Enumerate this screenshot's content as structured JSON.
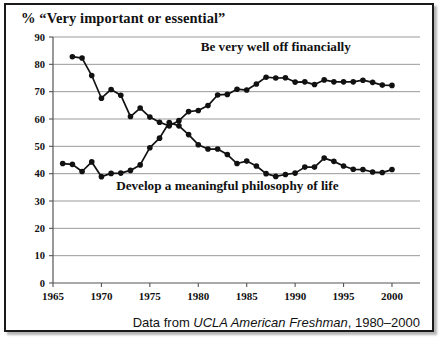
{
  "figure": {
    "title": "% “Very important or essential”",
    "caption_prefix": "Data from ",
    "caption_source": "UCLA American Freshman",
    "caption_suffix": ", 1980–2000",
    "border_color": "#1a1a1a",
    "background_color": "#ffffff"
  },
  "chart_data": {
    "type": "line",
    "title": "% “Very important or essential”",
    "xlabel": "",
    "ylabel": "",
    "xlim": [
      1965,
      2001
    ],
    "ylim": [
      0,
      90
    ],
    "grid": true,
    "grid_color": "#9a9a9a",
    "legend_position": "inline-annotation",
    "line_color": "#111111",
    "marker": "filled-circle",
    "xticks": [
      1965,
      1970,
      1975,
      1980,
      1985,
      1990,
      1995,
      2000
    ],
    "yticks": [
      0,
      10,
      20,
      30,
      40,
      50,
      60,
      70,
      80,
      90
    ],
    "series": [
      {
        "name": "Be very well off financially",
        "label_position": "top-right",
        "x": [
          1967,
          1968,
          1969,
          1970,
          1971,
          1972,
          1973,
          1974,
          1975,
          1976,
          1977,
          1978,
          1979,
          1980,
          1981,
          1982,
          1983,
          1984,
          1985,
          1986,
          1987,
          1988,
          1989,
          1990,
          1991,
          1992,
          1993,
          1994,
          1995,
          1996,
          1997,
          1998,
          1999,
          2000
        ],
        "values": [
          82.8,
          82.3,
          75.9,
          67.6,
          70.8,
          68.7,
          60.9,
          64.0,
          60.7,
          58.8,
          57.5,
          59.4,
          62.7,
          63.1,
          64.9,
          68.8,
          69.0,
          70.9,
          70.6,
          72.8,
          75.3,
          75.0,
          75.1,
          73.5,
          73.6,
          72.6,
          74.3,
          73.6,
          73.6,
          73.6,
          74.2,
          73.4,
          72.4,
          72.3
        ]
      },
      {
        "name": "Develop a meaningful philosophy of life",
        "label_position": "center-bottom",
        "x": [
          1966,
          1967,
          1968,
          1969,
          1970,
          1971,
          1972,
          1973,
          1974,
          1975,
          1976,
          1977,
          1978,
          1979,
          1980,
          1981,
          1982,
          1983,
          1984,
          1985,
          1986,
          1987,
          1988,
          1989,
          1990,
          1991,
          1992,
          1993,
          1994,
          1995,
          1996,
          1997,
          1998,
          1999,
          2000
        ],
        "values": [
          43.7,
          43.4,
          40.8,
          44.3,
          38.9,
          40.1,
          40.2,
          41.2,
          43.2,
          49.5,
          53.0,
          58.7,
          57.5,
          54.3,
          50.6,
          49.0,
          49.0,
          47.0,
          43.7,
          44.6,
          42.8,
          40.0,
          39.0,
          39.7,
          40.2,
          42.4,
          42.4,
          45.7,
          44.5,
          42.8,
          41.6,
          41.5,
          40.6,
          40.4,
          41.5
        ]
      }
    ],
    "annotations": [
      {
        "text": "Be very well off financially",
        "x": 1988,
        "y": 85
      },
      {
        "text": "Develop a meaningful philosophy of life",
        "x": 1983,
        "y": 34
      }
    ]
  }
}
